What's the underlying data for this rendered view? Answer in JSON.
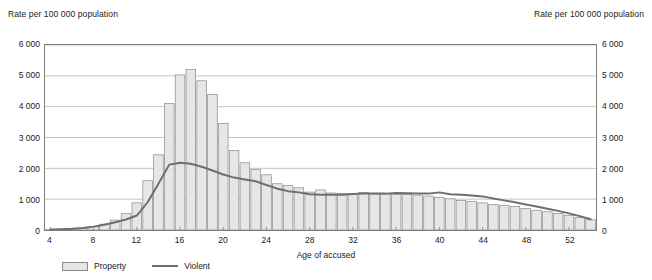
{
  "titles": {
    "left_axis": "Rate per 100 000 population",
    "right_axis": "Rate per 100 000 population",
    "xaxis": "Age of accused"
  },
  "legend": {
    "property_label": "Property",
    "violent_label": "Violent"
  },
  "colors": {
    "bar_fill": "#e6e6e6",
    "bar_stroke": "#8a8a8a",
    "line": "#6e6e6e",
    "gridline": "#b5b5b5",
    "frame": "#7d7d7d",
    "text": "#1a1a1a"
  },
  "chart_data": {
    "type": "bar",
    "title": "",
    "subtitle": "",
    "xlabel": "Age of accused",
    "ylabel": "Rate per 100 000 population",
    "xlim": [
      3.5,
      54.5
    ],
    "ylim": [
      0,
      6000
    ],
    "ytick_labels": [
      "0",
      "1 000",
      "2 000",
      "3 000",
      "4 000",
      "5 000",
      "6 000"
    ],
    "ytick_values": [
      0,
      1000,
      2000,
      3000,
      4000,
      5000,
      6000
    ],
    "xtick_labels": [
      "4",
      "8",
      "12",
      "16",
      "20",
      "24",
      "28",
      "32",
      "36",
      "40",
      "44",
      "48",
      "52"
    ],
    "xtick_values": [
      4,
      8,
      12,
      16,
      20,
      24,
      28,
      32,
      36,
      40,
      44,
      48,
      52
    ],
    "grid": "horizontal",
    "legend_position": "bottom-left",
    "x": [
      4,
      5,
      6,
      7,
      8,
      9,
      10,
      11,
      12,
      13,
      14,
      15,
      16,
      17,
      18,
      19,
      20,
      21,
      22,
      23,
      24,
      25,
      26,
      27,
      28,
      29,
      30,
      31,
      32,
      33,
      34,
      35,
      36,
      37,
      38,
      39,
      40,
      41,
      42,
      43,
      44,
      45,
      46,
      47,
      48,
      49,
      50,
      51,
      52,
      53,
      54
    ],
    "series": [
      {
        "name": "Property",
        "type": "bar",
        "values": [
          10,
          20,
          35,
          60,
          110,
          190,
          320,
          530,
          880,
          1600,
          2440,
          4100,
          5030,
          5210,
          4840,
          4390,
          3460,
          2580,
          2180,
          1960,
          1790,
          1500,
          1440,
          1370,
          1230,
          1300,
          1200,
          1180,
          1180,
          1220,
          1170,
          1160,
          1160,
          1150,
          1130,
          1100,
          1060,
          1010,
          960,
          930,
          880,
          830,
          800,
          760,
          700,
          640,
          590,
          540,
          470,
          410,
          330
        ]
      },
      {
        "name": "Violent",
        "type": "line",
        "values": [
          15,
          25,
          40,
          65,
          110,
          170,
          250,
          340,
          470,
          900,
          1500,
          2120,
          2180,
          2150,
          2050,
          1930,
          1800,
          1700,
          1640,
          1580,
          1460,
          1340,
          1260,
          1220,
          1160,
          1140,
          1140,
          1140,
          1170,
          1180,
          1180,
          1180,
          1200,
          1190,
          1180,
          1180,
          1220,
          1160,
          1140,
          1120,
          1090,
          1020,
          960,
          900,
          830,
          760,
          690,
          620,
          540,
          450,
          350
        ]
      }
    ]
  }
}
